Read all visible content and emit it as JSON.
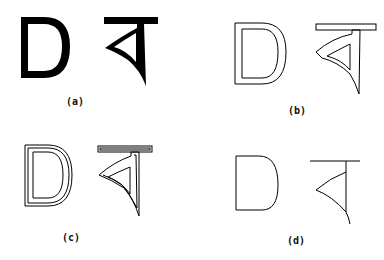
{
  "figure": {
    "panels": [
      {
        "id": "a",
        "caption": "(a)",
        "style": "solid filled glyphs"
      },
      {
        "id": "b",
        "caption": "(b)",
        "style": "single outline"
      },
      {
        "id": "c",
        "caption": "(c)",
        "style": "double outline"
      },
      {
        "id": "d",
        "caption": "(d)",
        "style": "skeleton / thinned"
      }
    ],
    "glyphs": [
      "D",
      "ব"
    ],
    "colors": {
      "ink": "#000000",
      "background": "#ffffff"
    }
  }
}
